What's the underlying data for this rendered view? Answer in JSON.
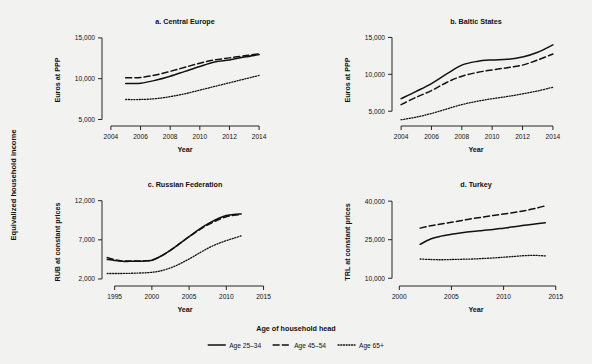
{
  "figure": {
    "outer_ylabel": "Equivalized household income",
    "background_color": "#f2f2f0",
    "line_color": "#111111"
  },
  "legend": {
    "title": "Age of household head",
    "position": "bottom-center",
    "entries": [
      {
        "label": "Age 25–34",
        "style": "solid"
      },
      {
        "label": "Age 45–54",
        "style": "dashed"
      },
      {
        "label": "Age 65+",
        "style": "dotted"
      }
    ]
  },
  "chart_data": [
    {
      "type": "line",
      "title": "a. Central Europe",
      "xlabel": "Year",
      "ylabel": "Euros at PPP",
      "xlim": [
        2003.4,
        2014.6
      ],
      "ylim": [
        4200,
        15600
      ],
      "xticks": [
        2004,
        2006,
        2008,
        2010,
        2012,
        2014
      ],
      "xticklabels": [
        "2004",
        "2006",
        "2008",
        "2010",
        "2012",
        "2014"
      ],
      "yticks": [
        5000,
        10000,
        15000
      ],
      "yticklabels": [
        "5,000",
        "10,000",
        "15,000"
      ],
      "grid": false,
      "x": [
        2005,
        2006,
        2007,
        2008,
        2009,
        2010,
        2011,
        2012,
        2013,
        2014
      ],
      "series": [
        {
          "name": "Age 25–34",
          "style": "solid",
          "values": [
            9400,
            9450,
            9800,
            10300,
            10900,
            11500,
            12050,
            12300,
            12650,
            12950
          ]
        },
        {
          "name": "Age 45–54",
          "style": "dashed",
          "values": [
            10100,
            10150,
            10450,
            10900,
            11400,
            11900,
            12300,
            12550,
            12800,
            13050
          ]
        },
        {
          "name": "Age 65+",
          "style": "dotted",
          "values": [
            7450,
            7450,
            7550,
            7800,
            8150,
            8600,
            9050,
            9500,
            9950,
            10400
          ]
        }
      ]
    },
    {
      "type": "line",
      "title": "b. Baltic States",
      "xlabel": "Year",
      "ylabel": "Euros at PPP",
      "xlim": [
        2003.4,
        2014.6
      ],
      "ylim": [
        3000,
        15600
      ],
      "xticks": [
        2004,
        2006,
        2008,
        2010,
        2012,
        2014
      ],
      "xticklabels": [
        "2004",
        "2006",
        "2008",
        "2010",
        "2012",
        "2014"
      ],
      "yticks": [
        5000,
        10000,
        15000
      ],
      "yticklabels": [
        "5,000",
        "10,000",
        "15,000"
      ],
      "grid": false,
      "x": [
        2004,
        2005,
        2006,
        2007,
        2008,
        2009,
        2010,
        2011,
        2012,
        2013,
        2014
      ],
      "series": [
        {
          "name": "Age 25–34",
          "style": "solid",
          "values": [
            6700,
            7700,
            8750,
            10050,
            11250,
            11750,
            11950,
            12050,
            12350,
            13000,
            14000
          ]
        },
        {
          "name": "Age 45–54",
          "style": "dashed",
          "values": [
            5900,
            6900,
            7800,
            8900,
            9750,
            10250,
            10600,
            10900,
            11250,
            11950,
            12750
          ]
        },
        {
          "name": "Age 65+",
          "style": "dotted",
          "values": [
            3850,
            4200,
            4700,
            5300,
            5900,
            6350,
            6700,
            7000,
            7350,
            7750,
            8250
          ]
        }
      ]
    },
    {
      "type": "line",
      "title": "c. Russian Federation",
      "xlabel": "Year",
      "ylabel": "RUB at constant prices",
      "xlim": [
        1993.3,
        2015.6
      ],
      "ylim": [
        1100,
        12600
      ],
      "xticks": [
        1995,
        2000,
        2005,
        2010,
        2015
      ],
      "xticklabels": [
        "1995",
        "2000",
        "2005",
        "2010",
        "2015"
      ],
      "yticks": [
        2000,
        7000,
        12000
      ],
      "yticklabels": [
        "2,000",
        "7,000",
        "12,000"
      ],
      "grid": false,
      "x": [
        1994,
        1995,
        1996,
        1997,
        1998,
        1999,
        2000,
        2001,
        2002,
        2003,
        2004,
        2005,
        2006,
        2007,
        2008,
        2009,
        2010,
        2011,
        2012
      ],
      "series": [
        {
          "name": "Age 25–34",
          "style": "solid",
          "values": [
            4500,
            4350,
            4250,
            4250,
            4250,
            4300,
            4400,
            4800,
            5350,
            6000,
            6700,
            7400,
            8100,
            8750,
            9300,
            9750,
            10100,
            10250,
            10300
          ]
        },
        {
          "name": "Age 45–54",
          "style": "dashed",
          "values": [
            4750,
            4450,
            4300,
            4300,
            4280,
            4300,
            4400,
            4800,
            5350,
            6000,
            6700,
            7400,
            8050,
            8650,
            9150,
            9600,
            9950,
            10150,
            10250
          ]
        },
        {
          "name": "Age 65+",
          "style": "dotted",
          "values": [
            2700,
            2700,
            2700,
            2720,
            2750,
            2780,
            2850,
            3000,
            3250,
            3600,
            4050,
            4550,
            5100,
            5650,
            6150,
            6550,
            6900,
            7200,
            7500
          ]
        }
      ]
    },
    {
      "type": "line",
      "title": "d. Turkey",
      "xlabel": "Year",
      "ylabel": "TRL at constant prices",
      "xlim": [
        1999.3,
        2015.6
      ],
      "ylim": [
        7000,
        42000
      ],
      "xticks": [
        2000,
        2005,
        2010,
        2015
      ],
      "xticklabels": [
        "2000",
        "2005",
        "2010",
        "2015"
      ],
      "yticks": [
        10000,
        25000,
        40000
      ],
      "yticklabels": [
        "10,000",
        "25,000",
        "40,000"
      ],
      "grid": false,
      "x": [
        2002,
        2003,
        2004,
        2005,
        2006,
        2007,
        2008,
        2009,
        2010,
        2011,
        2012,
        2013,
        2014
      ],
      "series": [
        {
          "name": "Age 25–34",
          "style": "solid",
          "values": [
            23200,
            25300,
            26400,
            27100,
            27700,
            28200,
            28600,
            29000,
            29500,
            30000,
            30600,
            31100,
            31600
          ]
        },
        {
          "name": "Age 45–54",
          "style": "dashed",
          "values": [
            29500,
            30400,
            31100,
            31800,
            32500,
            33200,
            33800,
            34400,
            35000,
            35600,
            36300,
            37100,
            38200
          ]
        },
        {
          "name": "Age 65+",
          "style": "dotted",
          "values": [
            17500,
            17300,
            17200,
            17300,
            17400,
            17500,
            17700,
            17900,
            18200,
            18500,
            18800,
            18900,
            18700
          ]
        }
      ]
    }
  ]
}
